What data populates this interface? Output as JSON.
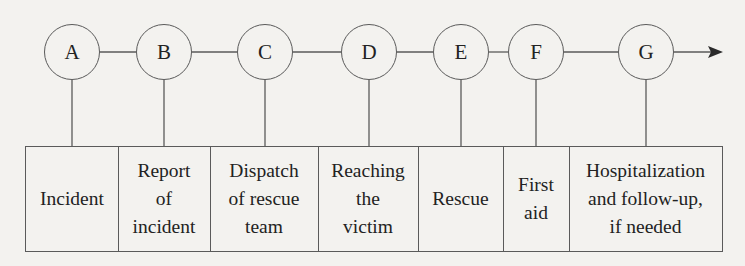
{
  "diagram": {
    "type": "process-timeline",
    "direction": "left-to-right",
    "colors": {
      "background": "#f3f2ef",
      "line": "#5a5a5a",
      "text": "#222222"
    },
    "nodes": [
      {
        "id": "A",
        "label": "A"
      },
      {
        "id": "B",
        "label": "B"
      },
      {
        "id": "C",
        "label": "C"
      },
      {
        "id": "D",
        "label": "D"
      },
      {
        "id": "E",
        "label": "E"
      },
      {
        "id": "F",
        "label": "F"
      },
      {
        "id": "G",
        "label": "G"
      }
    ],
    "stages": [
      {
        "node": "A",
        "text": "Incident"
      },
      {
        "node": "B",
        "text": "Report\nof\nincident"
      },
      {
        "node": "C",
        "text": "Dispatch\nof rescue\nteam"
      },
      {
        "node": "D",
        "text": "Reaching\nthe\nvictim"
      },
      {
        "node": "E",
        "text": "Rescue"
      },
      {
        "node": "F",
        "text": "First\naid"
      },
      {
        "node": "G",
        "text": "Hospitalization\nand follow-up,\nif needed"
      }
    ],
    "arrow": {
      "icon": "arrow-right-icon",
      "meaning": "continuation in time"
    }
  }
}
